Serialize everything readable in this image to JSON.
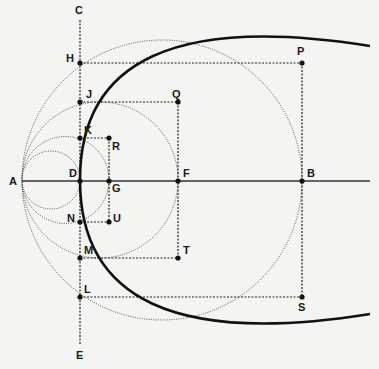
{
  "diagram": {
    "type": "geometric-construction",
    "colors": {
      "background": "#f4f4f3",
      "ink": "#111111"
    },
    "points": {
      "A": {
        "label": "A",
        "x": 22,
        "y": 180
      },
      "B": {
        "label": "B",
        "x": 302,
        "y": 180
      },
      "C": {
        "label": "C",
        "x": 80,
        "y": 20
      },
      "D": {
        "label": "D",
        "x": 80,
        "y": 180
      },
      "E": {
        "label": "E",
        "x": 80,
        "y": 345
      },
      "F": {
        "label": "F",
        "x": 178,
        "y": 180
      },
      "G": {
        "label": "G",
        "x": 109,
        "y": 180
      },
      "H": {
        "label": "H",
        "x": 80,
        "y": 63
      },
      "J": {
        "label": "J",
        "x": 80,
        "y": 102
      },
      "K": {
        "label": "K",
        "x": 80,
        "y": 138
      },
      "L": {
        "label": "L",
        "x": 80,
        "y": 297
      },
      "M": {
        "label": "M",
        "x": 80,
        "y": 258
      },
      "N": {
        "label": "N",
        "x": 80,
        "y": 222
      },
      "P": {
        "label": "P",
        "x": 302,
        "y": 63
      },
      "Q": {
        "label": "Q",
        "x": 178,
        "y": 102
      },
      "R": {
        "label": "R",
        "x": 109,
        "y": 138
      },
      "S": {
        "label": "S",
        "x": 302,
        "y": 297
      },
      "T": {
        "label": "T",
        "x": 178,
        "y": 258
      },
      "U": {
        "label": "U",
        "x": 109,
        "y": 222
      }
    },
    "circles": [
      {
        "name": "circle-AD",
        "through": [
          "A",
          "D"
        ]
      },
      {
        "name": "circle-AG",
        "through": [
          "A",
          "K",
          "G",
          "N"
        ]
      },
      {
        "name": "circle-AF",
        "through": [
          "A",
          "J",
          "F",
          "M"
        ]
      },
      {
        "name": "circle-AB",
        "through": [
          "A",
          "H",
          "B",
          "L"
        ]
      }
    ],
    "lines": {
      "axis": "A-B horizontal axis",
      "directrix": "C-E vertical line through D"
    },
    "curve": {
      "name": "parabola",
      "vertex": "D",
      "through": [
        "P",
        "Q",
        "R",
        "D",
        "U",
        "T",
        "S"
      ]
    }
  }
}
